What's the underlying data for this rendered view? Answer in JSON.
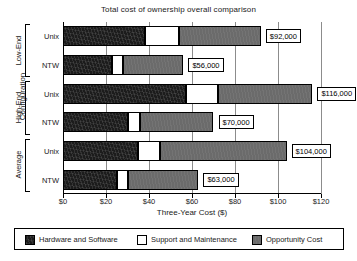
{
  "chart_data": {
    "type": "bar",
    "orientation": "horizontal",
    "stacked": true,
    "title": "Total cost of ownership overall comparison",
    "xlabel": "Three-Year Cost ($)",
    "ylabel": "Configuration",
    "xlim": [
      0,
      120
    ],
    "xticks": [
      0,
      20,
      40,
      60,
      80,
      100,
      120
    ],
    "xtick_labels": [
      "$0",
      "$20",
      "$40",
      "$60",
      "$80",
      "$100",
      "$120"
    ],
    "grid": true,
    "legend_position": "bottom",
    "series": [
      {
        "name": "Hardware and Software",
        "color": "#1c1c1c",
        "values": [
          38,
          23,
          57,
          30,
          35,
          25
        ]
      },
      {
        "name": "Support and Maintenance",
        "color": "#ffffff",
        "values": [
          16,
          5,
          15,
          6,
          10,
          5
        ]
      },
      {
        "name": "Opportunity Cost",
        "color": "#6b6b6b",
        "values": [
          38,
          28,
          44,
          34,
          59,
          33
        ]
      }
    ],
    "groups": [
      {
        "name": "Low-End",
        "categories": [
          "Unix",
          "NTW"
        ],
        "totals": [
          92,
          56
        ],
        "total_labels": [
          "$92,000",
          "$56,000"
        ]
      },
      {
        "name": "High-End",
        "categories": [
          "Unix",
          "NTW"
        ],
        "totals": [
          116,
          70
        ],
        "total_labels": [
          "$116,000",
          "$70,000"
        ]
      },
      {
        "name": "Average",
        "categories": [
          "Unix",
          "NTW"
        ],
        "totals": [
          104,
          63
        ],
        "total_labels": [
          "$104,000",
          "$63,000"
        ]
      }
    ],
    "bars": [
      {
        "group": "Low-End",
        "category": "Unix",
        "segments": [
          38,
          16,
          38
        ],
        "total": 92,
        "label": "$92,000"
      },
      {
        "group": "Low-End",
        "category": "NTW",
        "segments": [
          23,
          5,
          28
        ],
        "total": 56,
        "label": "$56,000"
      },
      {
        "group": "High-End",
        "category": "Unix",
        "segments": [
          57,
          15,
          44
        ],
        "total": 116,
        "label": "$116,000"
      },
      {
        "group": "High-End",
        "category": "NTW",
        "segments": [
          30,
          6,
          34
        ],
        "total": 70,
        "label": "$70,000"
      },
      {
        "group": "Average",
        "category": "Unix",
        "segments": [
          35,
          10,
          59
        ],
        "total": 104,
        "label": "$104,000"
      },
      {
        "group": "Average",
        "category": "NTW",
        "segments": [
          25,
          5,
          33
        ],
        "total": 63,
        "label": "$63,000"
      }
    ]
  },
  "legend": {
    "items": [
      {
        "label": "Hardware and Software",
        "color": "#1c1c1c"
      },
      {
        "label": "Support and Maintenance",
        "color": "#ffffff"
      },
      {
        "label": "Opportunity Cost",
        "color": "#6b6b6b"
      }
    ]
  }
}
